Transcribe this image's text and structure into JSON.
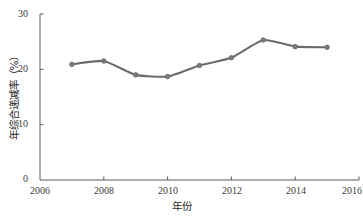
{
  "chart_data": {
    "type": "line",
    "title": "",
    "xlabel": "年份",
    "ylabel": "年综合递减率（%）",
    "x": [
      2007,
      2008,
      2009,
      2010,
      2011,
      2012,
      2013,
      2014,
      2015
    ],
    "values": [
      20.9,
      21.5,
      19.0,
      18.7,
      20.7,
      22.1,
      25.3,
      24.1,
      24.0
    ],
    "series": [
      {
        "name": "年综合递减率",
        "values": [
          20.9,
          21.5,
          19.0,
          18.7,
          20.7,
          22.1,
          25.3,
          24.1,
          24.0
        ]
      }
    ],
    "xlim": [
      2006,
      2016
    ],
    "ylim": [
      0,
      30
    ],
    "xticks": [
      "2006",
      "2008",
      "2010",
      "2012",
      "2014",
      "2016"
    ],
    "xtick_values": [
      2006,
      2008,
      2010,
      2012,
      2014,
      2016
    ],
    "yticks": [
      "0",
      "10",
      "20",
      "30"
    ],
    "ytick_values": [
      0,
      10,
      20,
      30
    ],
    "grid": false,
    "legend": "none",
    "line_color": "#6b6b6b",
    "marker_color": "#7a7a7a",
    "axis_color": "#5a5a5a"
  }
}
